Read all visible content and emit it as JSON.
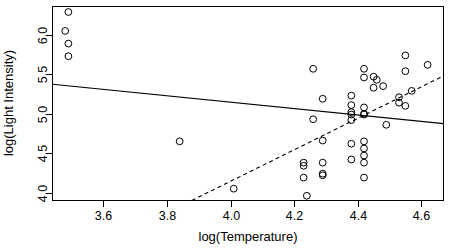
{
  "chart_data": {
    "type": "scatter",
    "title": "",
    "xlabel": "log(Temperature)",
    "ylabel": "log(Light Intensity)",
    "xlim": [
      3.44,
      4.67
    ],
    "ylim": [
      3.9,
      6.36
    ],
    "xticks": [
      3.6,
      3.8,
      4.0,
      4.2,
      4.4,
      4.6
    ],
    "xtick_labels": [
      "3.6",
      "3.8",
      "4.0",
      "4.2",
      "4.4",
      "4.6"
    ],
    "yticks": [
      4.0,
      4.5,
      5.0,
      5.5,
      6.0
    ],
    "ytick_labels": [
      "4.0",
      "4.5",
      "5.0",
      "5.5",
      "6.0"
    ],
    "grid": false,
    "legend": null,
    "point_marker": "open-circle",
    "point_color": "#000000",
    "points": [
      {
        "x": 3.49,
        "y": 6.29
      },
      {
        "x": 3.48,
        "y": 6.05
      },
      {
        "x": 3.49,
        "y": 5.89
      },
      {
        "x": 3.49,
        "y": 5.73
      },
      {
        "x": 3.84,
        "y": 4.65
      },
      {
        "x": 4.01,
        "y": 4.05
      },
      {
        "x": 4.23,
        "y": 4.38
      },
      {
        "x": 4.23,
        "y": 4.34
      },
      {
        "x": 4.23,
        "y": 4.19
      },
      {
        "x": 4.24,
        "y": 3.96
      },
      {
        "x": 4.26,
        "y": 5.57
      },
      {
        "x": 4.26,
        "y": 4.93
      },
      {
        "x": 4.29,
        "y": 5.19
      },
      {
        "x": 4.29,
        "y": 4.66
      },
      {
        "x": 4.29,
        "y": 4.38
      },
      {
        "x": 4.29,
        "y": 4.24
      },
      {
        "x": 4.29,
        "y": 4.22
      },
      {
        "x": 4.38,
        "y": 5.23
      },
      {
        "x": 4.38,
        "y": 5.11
      },
      {
        "x": 4.38,
        "y": 5.02
      },
      {
        "x": 4.38,
        "y": 4.99
      },
      {
        "x": 4.38,
        "y": 4.92
      },
      {
        "x": 4.38,
        "y": 4.62
      },
      {
        "x": 4.38,
        "y": 4.42
      },
      {
        "x": 4.42,
        "y": 5.57
      },
      {
        "x": 4.42,
        "y": 5.46
      },
      {
        "x": 4.42,
        "y": 5.08
      },
      {
        "x": 4.42,
        "y": 5.0
      },
      {
        "x": 4.42,
        "y": 4.99
      },
      {
        "x": 4.42,
        "y": 4.65
      },
      {
        "x": 4.42,
        "y": 4.56
      },
      {
        "x": 4.42,
        "y": 4.47
      },
      {
        "x": 4.42,
        "y": 4.38
      },
      {
        "x": 4.42,
        "y": 4.19
      },
      {
        "x": 4.45,
        "y": 5.47
      },
      {
        "x": 4.45,
        "y": 5.33
      },
      {
        "x": 4.46,
        "y": 5.43
      },
      {
        "x": 4.48,
        "y": 5.35
      },
      {
        "x": 4.49,
        "y": 4.86
      },
      {
        "x": 4.53,
        "y": 5.21
      },
      {
        "x": 4.53,
        "y": 5.14
      },
      {
        "x": 4.55,
        "y": 5.74
      },
      {
        "x": 4.55,
        "y": 5.54
      },
      {
        "x": 4.55,
        "y": 5.1
      },
      {
        "x": 4.57,
        "y": 5.29
      },
      {
        "x": 4.62,
        "y": 5.62
      }
    ],
    "lines": [
      {
        "name": "ols-fit",
        "style": "solid",
        "color": "#000000",
        "endpoints": [
          {
            "x": 3.44,
            "y": 5.375
          },
          {
            "x": 4.67,
            "y": 4.875
          }
        ]
      },
      {
        "name": "robust-fit",
        "style": "dashed",
        "color": "#000000",
        "endpoints": [
          {
            "x": 3.878,
            "y": 3.9
          },
          {
            "x": 4.67,
            "y": 5.48
          }
        ]
      }
    ]
  }
}
